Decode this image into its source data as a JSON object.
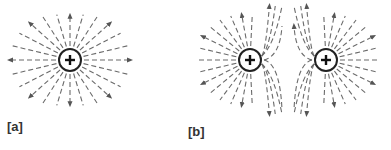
{
  "figure": {
    "panels": [
      {
        "id": "a",
        "label": "[a]",
        "description": "Electric field lines radiating outward from a single positive charge",
        "charges": [
          {
            "sign": "+",
            "cx": 70,
            "cy": 60,
            "r": 11
          }
        ]
      },
      {
        "id": "b",
        "label": "[b]",
        "description": "Electric field lines of two equal positive charges repelling, with a neutral point between them",
        "charges": [
          {
            "sign": "+",
            "cx": 250,
            "cy": 60,
            "r": 11
          },
          {
            "sign": "+",
            "cx": 326,
            "cy": 60,
            "r": 11
          }
        ]
      }
    ],
    "colors": {
      "field_line": "#6b6b6b",
      "charge_outline": "#222222",
      "label": "#333333",
      "background": "#ffffff"
    }
  }
}
